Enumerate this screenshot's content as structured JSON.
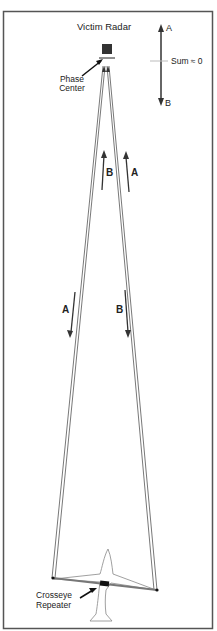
{
  "title": "Victim Radar",
  "labels": {
    "phase_center_line1": "Phase",
    "phase_center_line2": "Center",
    "legend_top": "A",
    "legend_bottom": "B",
    "sum": "Sum ≈ 0",
    "upper_left_arrow": "B",
    "upper_right_arrow": "A",
    "lower_left_arrow": "A",
    "lower_right_arrow": "B",
    "repeater_line1": "Crosseye",
    "repeater_line2": "Repeater"
  },
  "colors": {
    "stroke": "#333333",
    "frame": "#555555",
    "radar": "#333333",
    "aircraft": "#888888"
  }
}
